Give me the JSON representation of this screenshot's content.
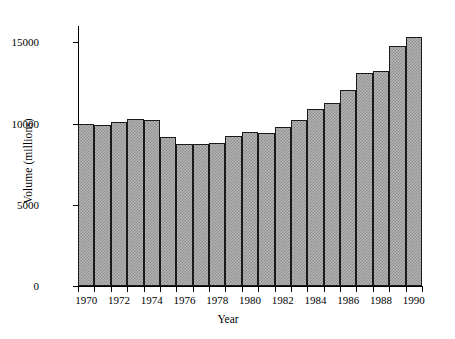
{
  "chart_data": {
    "type": "bar",
    "title": "",
    "xlabel": "Year",
    "ylabel": "Volume (millions)",
    "categories": [
      "1970",
      "1971",
      "1972",
      "1973",
      "1974",
      "1975",
      "1976",
      "1977",
      "1978",
      "1979",
      "1980",
      "1981",
      "1982",
      "1983",
      "1984",
      "1985",
      "1986",
      "1987",
      "1988",
      "1989",
      "1990"
    ],
    "values": [
      9950,
      9900,
      10100,
      10300,
      10200,
      9200,
      8750,
      8750,
      8800,
      9250,
      9500,
      9400,
      9800,
      10200,
      10900,
      11250,
      12050,
      13100,
      13250,
      14800,
      15300
    ],
    "ylim": [
      0,
      16000
    ],
    "yticks": [
      0,
      5000,
      10000,
      15000
    ],
    "ytick_labels": [
      "0",
      "5000",
      "10000",
      "15000"
    ],
    "xticks": [
      "1970",
      "1972",
      "1974",
      "1976",
      "1978",
      "1980",
      "1982",
      "1984",
      "1986",
      "1988",
      "1990"
    ],
    "grid": false,
    "legend": null,
    "bar_facecolor": "#b4b4b4",
    "bar_edgecolor": "#1a1a1a",
    "background_color": "#ffffff",
    "axis_color": "#000000"
  }
}
